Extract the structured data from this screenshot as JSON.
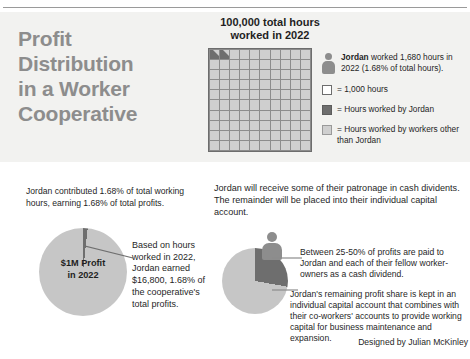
{
  "headline": {
    "lines": [
      "Profit",
      "Distribution",
      "in a Worker",
      "Cooperative"
    ]
  },
  "grid_section": {
    "title_line1": "100,000 total hours",
    "title_line2": "worked in 2022"
  },
  "legend": {
    "person_text_bold": "Jordan",
    "person_text_rest": " worked 1,680 hours in 2022 (1.68% of total hours).",
    "items": [
      {
        "swatch": "white-square-icon",
        "label": "= 1,000 hours"
      },
      {
        "swatch": "dark-square-icon",
        "label": "= Hours worked by Jordan"
      },
      {
        "swatch": "light-square-icon",
        "label": "= Hours worked by workers other than Jordan"
      }
    ]
  },
  "lower_left": {
    "intro": "Jordan contributed 1.68% of total working hours, earning 1.68% of total profits.",
    "pie_label_line1": "$1M Profit",
    "pie_label_line2": "in 2022",
    "callout": "Based on hours worked in 2022, Jordan earned $16,800, 1.68% of the cooperative's total profits."
  },
  "lower_right": {
    "intro": "Jordan will receive some of their patronage in cash dividents. The remainder will be placed into their individual capital account.",
    "callout1": "Between 25-50% of profits are paid to Jordan and each of their fellow worker-owners as a cash dividend.",
    "callout2": "Jordan's remaining profit share is kept in an individual capital account that combines with their co-workers' accounts to provide working capital for business maintenance and expansion."
  },
  "credit": "Designed by Julian McKinley",
  "colors": {
    "panel_background": "#f2f2f0",
    "headline_gray": "#8d8d8d",
    "dark_gray": "#6e6e6e",
    "light_gray": "#cfcfcf",
    "pie_light": "#c6c6c6",
    "text": "#1f1f1f"
  },
  "chart_data": [
    {
      "type": "heatmap",
      "title": "100,000 total hours worked in 2022",
      "grid_rows": 10,
      "grid_cols": 10,
      "cell_value": 1000,
      "cell_unit": "hours",
      "total": 100000,
      "highlighted_cells": 1.68,
      "series": [
        {
          "name": "Hours worked by Jordan",
          "values": [
            1680
          ],
          "color": "#6e6e6e"
        },
        {
          "name": "Hours worked by workers other than Jordan",
          "values": [
            98320
          ],
          "color": "#cfcfcf"
        }
      ],
      "legend": [
        "= 1,000 hours",
        "= Hours worked by Jordan",
        "= Hours worked by workers other than Jordan"
      ]
    },
    {
      "type": "pie",
      "title": "$1M Profit in 2022",
      "categories": [
        "Jordan's share",
        "Remaining profits"
      ],
      "values": [
        1.68,
        98.32
      ],
      "value_unit": "%",
      "annotations": [
        "$16,800 is 1.68% of the cooperative's total profits"
      ],
      "colors": [
        "#6e6e6e",
        "#c6c6c6"
      ]
    },
    {
      "type": "pie",
      "title": "Jordan's patronage split",
      "categories": [
        "Cash dividend (25-50%)",
        "Individual capital account"
      ],
      "values": [
        28,
        72
      ],
      "value_unit": "%",
      "annotations": [
        "Between 25-50% of profits are paid as a cash dividend"
      ],
      "colors": [
        "#6e6e6e",
        "#c6c6c6"
      ]
    }
  ]
}
